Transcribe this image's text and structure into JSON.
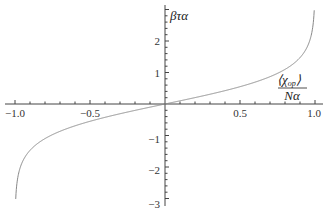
{
  "chart_data": {
    "type": "line",
    "title": "",
    "xlabel": "⟨χ_op⟩ / Nα",
    "xlabel_parts": {
      "numerator": "⟨χ",
      "subscript": "op",
      "numerator_close": "⟩",
      "denominator": "Nα"
    },
    "ylabel": "βτα",
    "xlim": [
      -1.0,
      1.0
    ],
    "ylim": [
      -3,
      3
    ],
    "x_ticks": [
      -1.0,
      -0.5,
      0.5,
      1.0
    ],
    "x_tick_labels": [
      "-1.0",
      "-0.5",
      "0.5",
      "1.0"
    ],
    "y_ticks": [
      -3,
      -2,
      -1,
      1,
      2
    ],
    "y_tick_labels": [
      "-3",
      "-2",
      "-1",
      "1",
      "2"
    ],
    "grid": false,
    "legend": null,
    "line_color": "#888888",
    "series": [
      {
        "name": "βτα vs ⟨χ_op⟩/Nα",
        "x": [
          -0.995,
          -0.99,
          -0.98,
          -0.95,
          -0.9,
          -0.8,
          -0.7,
          -0.6,
          -0.5,
          -0.4,
          -0.3,
          -0.2,
          -0.1,
          0.0,
          0.1,
          0.2,
          0.3,
          0.4,
          0.5,
          0.6,
          0.7,
          0.8,
          0.9,
          0.95,
          0.98,
          0.99,
          0.995
        ],
        "values": [
          -2.99,
          -2.65,
          -2.3,
          -1.83,
          -1.47,
          -1.1,
          -0.87,
          -0.69,
          -0.55,
          -0.42,
          -0.31,
          -0.2,
          -0.1,
          0.0,
          0.1,
          0.2,
          0.31,
          0.42,
          0.55,
          0.69,
          0.87,
          1.1,
          1.47,
          1.83,
          2.3,
          2.65,
          2.99
        ]
      }
    ]
  },
  "labels": {
    "y_axis": "βτα",
    "x_axis_num_open": "⟨χ",
    "x_axis_num_sub": "op",
    "x_axis_num_close": "⟩",
    "x_axis_den": "Nα",
    "xt0": "−1.0",
    "xt1": "−0.5",
    "xt2": "0.5",
    "xt3": "1.0",
    "yt0": "2",
    "yt1": "1",
    "yt2": "−1",
    "yt3": "−2",
    "yt4": "−3"
  }
}
